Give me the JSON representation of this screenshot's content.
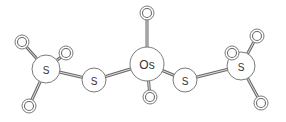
{
  "diagram": {
    "type": "molecule",
    "atoms": [
      {
        "id": "Os1",
        "symbol": "Os",
        "x": 147,
        "y": 64,
        "r": 17,
        "size": 12
      },
      {
        "id": "O1",
        "symbol": "O",
        "x": 147,
        "y": 13,
        "r": 7,
        "size": 9
      },
      {
        "id": "O2",
        "symbol": "O",
        "x": 150,
        "y": 97,
        "r": 7,
        "size": 9
      },
      {
        "id": "S1",
        "symbol": "S",
        "x": 94,
        "y": 80,
        "r": 12,
        "size": 10
      },
      {
        "id": "S2",
        "symbol": "S",
        "x": 185,
        "y": 80,
        "r": 12,
        "size": 10
      },
      {
        "id": "S3",
        "symbol": "S",
        "x": 46,
        "y": 69,
        "r": 14,
        "size": 10
      },
      {
        "id": "O3",
        "symbol": "O",
        "x": 22,
        "y": 42,
        "r": 7,
        "size": 9
      },
      {
        "id": "O4",
        "symbol": "O",
        "x": 66,
        "y": 53,
        "r": 7,
        "size": 9
      },
      {
        "id": "O5",
        "symbol": "O",
        "x": 29,
        "y": 106,
        "r": 7,
        "size": 9
      },
      {
        "id": "S4",
        "symbol": "S",
        "x": 241,
        "y": 66,
        "r": 14,
        "size": 10
      },
      {
        "id": "O6",
        "symbol": "O",
        "x": 232,
        "y": 53,
        "r": 7,
        "size": 9
      },
      {
        "id": "O7",
        "symbol": "O",
        "x": 257,
        "y": 36,
        "r": 7,
        "size": 9
      },
      {
        "id": "O8",
        "symbol": "O",
        "x": 261,
        "y": 103,
        "r": 7,
        "size": 9
      }
    ],
    "bonds": [
      [
        "Os1",
        "O1"
      ],
      [
        "Os1",
        "O2"
      ],
      [
        "Os1",
        "S1"
      ],
      [
        "Os1",
        "S2"
      ],
      [
        "S1",
        "S3"
      ],
      [
        "S3",
        "O3"
      ],
      [
        "S3",
        "O4"
      ],
      [
        "S3",
        "O5"
      ],
      [
        "S2",
        "S4"
      ],
      [
        "S4",
        "O6"
      ],
      [
        "S4",
        "O7"
      ],
      [
        "S4",
        "O8"
      ]
    ]
  }
}
